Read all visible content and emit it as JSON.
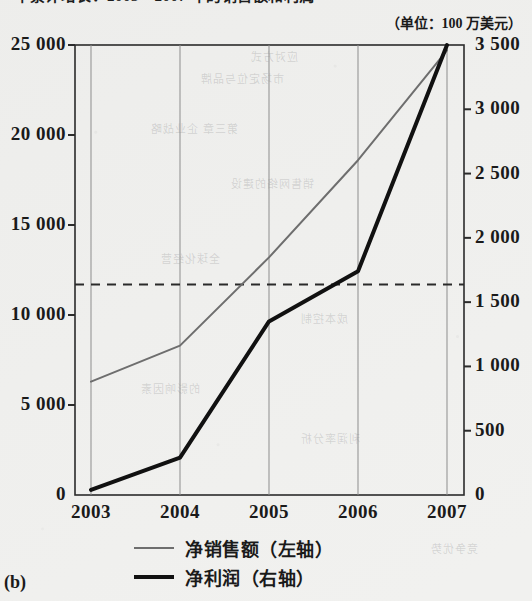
{
  "figure": {
    "title": "年累计增长：2003—2007 年的销售额和利润",
    "unit_note": "（单位：100 万美元）",
    "panel_tag": "(b)"
  },
  "legend": {
    "position": "bottom",
    "items": [
      {
        "label": "净销售额（左轴）",
        "color": "#6e6e6e",
        "thickness": 2
      },
      {
        "label": "净利润（右轴）",
        "color": "#111111",
        "thickness": 4
      }
    ]
  },
  "chart_data": {
    "type": "line",
    "title": "年累计增长：2003—2007 年的销售额和利润",
    "subtitle": "（单位：100 万美元）",
    "xlabel": "",
    "ylabel": "",
    "x": [
      "2003",
      "2004",
      "2005",
      "2006",
      "2007"
    ],
    "categories": [
      "2003",
      "2004",
      "2005",
      "2006",
      "2007"
    ],
    "grid": true,
    "gridlines": "vertical",
    "series": [
      {
        "name": "净销售额（左轴）",
        "axis": "left",
        "color": "#6e6e6e",
        "values": [
          6300,
          8300,
          13200,
          18600,
          24700
        ]
      },
      {
        "name": "净利润（右轴）",
        "axis": "right",
        "color": "#111111",
        "values": [
          40,
          290,
          1350,
          1740,
          3500
        ]
      }
    ],
    "left_axis": {
      "ticks": [
        "0",
        "5 000",
        "10 000",
        "15 000",
        "20 000",
        "25 000"
      ],
      "tick_values": [
        0,
        5000,
        10000,
        15000,
        20000,
        25000
      ],
      "ylim": [
        0,
        25000
      ]
    },
    "right_axis": {
      "ticks": [
        "0",
        "500",
        "1 000",
        "1 500",
        "2 000",
        "2 500",
        "3 000",
        "3 500"
      ],
      "tick_values": [
        0,
        500,
        1000,
        1500,
        2000,
        2500,
        3000,
        3500
      ],
      "ylim": [
        0,
        3500
      ]
    },
    "annotations": [
      {
        "type": "hline",
        "axis": "left",
        "value": 11700,
        "style": "dashed",
        "color": "#2a2a2a"
      }
    ]
  },
  "bleed_text": [
    "应对方式",
    "市场定位与品牌",
    "第三章 企业战略",
    "销售网络的建设",
    "全球化经营",
    "成本控制",
    "的影响因素",
    "利润率分析",
    "竞争优势"
  ]
}
